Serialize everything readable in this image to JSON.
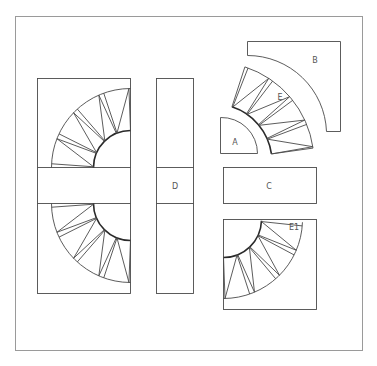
{
  "diagram": {
    "type": "quilt block pattern pieces",
    "labels": {
      "a": "A",
      "b": "B",
      "c": "C",
      "d": "D",
      "e": "E",
      "e1": "E1"
    },
    "colors": {
      "line": "#4a4a4a",
      "frame": "#9a9a9a",
      "background": "#ffffff"
    }
  }
}
